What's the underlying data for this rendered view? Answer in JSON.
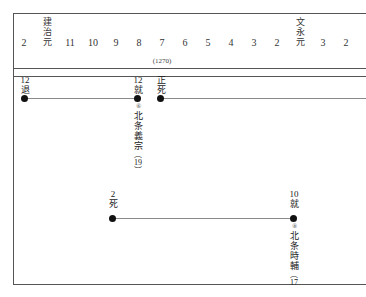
{
  "diagram": {
    "frame_color": "#555555",
    "line_color": "#8a8a8a",
    "dot_color": "#111111"
  },
  "header": {
    "columns": [
      {
        "label": "2",
        "era": null
      },
      {
        "label": null,
        "era": [
          "建",
          "治",
          "元"
        ]
      },
      {
        "label": "11",
        "era": null
      },
      {
        "label": "10",
        "era": null
      },
      {
        "label": "9",
        "era": null
      },
      {
        "label": "8",
        "era": null
      },
      {
        "label": "7",
        "era": null
      },
      {
        "label": "6",
        "era": null
      },
      {
        "label": "5",
        "era": null
      },
      {
        "label": "4",
        "era": null
      },
      {
        "label": "3",
        "era": null
      },
      {
        "label": "2",
        "era": null
      },
      {
        "label": null,
        "era": [
          "文",
          "永",
          "元"
        ]
      },
      {
        "label": "3",
        "era": null
      },
      {
        "label": "2",
        "era": null
      }
    ],
    "western_year": "(1270)"
  },
  "rows": [
    {
      "name": "row-upper",
      "events": [
        {
          "month": "12",
          "action": "退"
        },
        {
          "month": "12",
          "action": "就"
        },
        {
          "month": "正",
          "action": "死"
        }
      ],
      "person": {
        "marker": "⑥",
        "name": [
          "北",
          "条",
          "義",
          "宗"
        ],
        "age": "19"
      }
    },
    {
      "name": "row-lower",
      "events": [
        {
          "month": "2",
          "action": "死"
        },
        {
          "month": "10",
          "action": "就"
        }
      ],
      "person": {
        "marker": "⑧",
        "name": [
          "北",
          "条",
          "時",
          "輔"
        ],
        "age": "17"
      }
    }
  ]
}
